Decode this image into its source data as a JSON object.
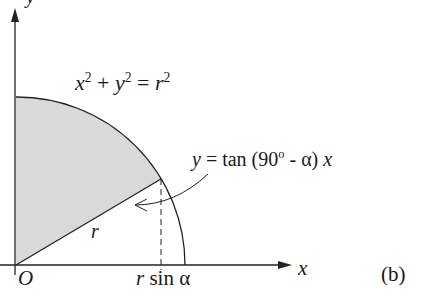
{
  "figure": {
    "panel_label": "(b)",
    "axes": {
      "x_label": "x",
      "y_label": "y",
      "origin_label": "O"
    },
    "circle_equation": {
      "lhs_x": "x",
      "exp1": "2",
      "plus": "+",
      "lhs_y": "y",
      "exp2": "2",
      "equals": "=",
      "rhs_r": "r",
      "exp3": "2"
    },
    "line_equation": {
      "y": "y",
      "equals_tan": "= tan (90",
      "degree": "o",
      "rest": " - α)",
      "x": "x"
    },
    "radius_label": "r",
    "tick_label": {
      "r": "r",
      "sin_alpha": "sin α"
    },
    "colors": {
      "shaded_region": "#d9d9d9",
      "lines": "#222222"
    }
  }
}
